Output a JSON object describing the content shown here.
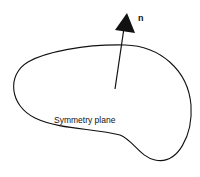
{
  "diagram": {
    "shape_label": "Symmetry plane",
    "vector_label": "n",
    "stroke_color": "#111111",
    "background": "#ffffff"
  }
}
